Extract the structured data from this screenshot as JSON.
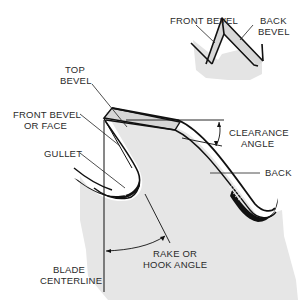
{
  "diagram": {
    "type": "saw-tooth-anatomy",
    "colors": {
      "background": "#ffffff",
      "blade_fill": "#e6e6e6",
      "bevel_fill": "#dcdcdc",
      "outline": "#111111",
      "text": "#2a2a2a"
    },
    "inset": {
      "labels": {
        "front_bevel": "FRONT BEVEL",
        "back_bevel_1": "BACK",
        "back_bevel_2": "BEVEL"
      }
    },
    "main": {
      "labels": {
        "top_bevel_1": "TOP",
        "top_bevel_2": "BEVEL",
        "front_face_1": "FRONT BEVEL",
        "front_face_2": "OR FACE",
        "gullet": "GULLET",
        "clearance_1": "CLEARANCE",
        "clearance_2": "ANGLE",
        "back": "BACK",
        "rake_1": "RAKE OR",
        "rake_2": "HOOK ANGLE",
        "centerline_1": "BLADE",
        "centerline_2": "CENTERLINE"
      }
    }
  }
}
